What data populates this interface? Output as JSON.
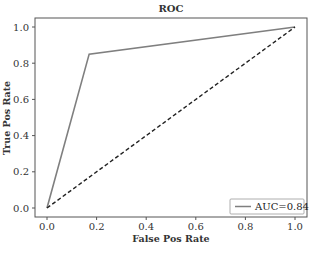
{
  "chart_data": {
    "type": "line",
    "title": "ROC",
    "xlabel": "False Pos Rate",
    "ylabel": "True Pos Rate",
    "xlim": [
      -0.05,
      1.05
    ],
    "ylim": [
      -0.05,
      1.05
    ],
    "xticks": [
      "0.0",
      "0.2",
      "0.4",
      "0.6",
      "0.8",
      "1.0"
    ],
    "yticks": [
      "0.0",
      "0.2",
      "0.4",
      "0.6",
      "0.8",
      "1.0"
    ],
    "grid": false,
    "legend_position": "lower right",
    "series": [
      {
        "name": "AUC=0.84",
        "style": "solid",
        "color": "#7f7f7f",
        "x": [
          0.0,
          0.17,
          1.0
        ],
        "y": [
          0.0,
          0.85,
          1.0
        ]
      },
      {
        "name": "chance",
        "style": "dashed",
        "color": "#222222",
        "x": [
          0.0,
          1.0
        ],
        "y": [
          0.0,
          1.0
        ]
      }
    ],
    "legend": [
      "AUC=0.84"
    ]
  }
}
